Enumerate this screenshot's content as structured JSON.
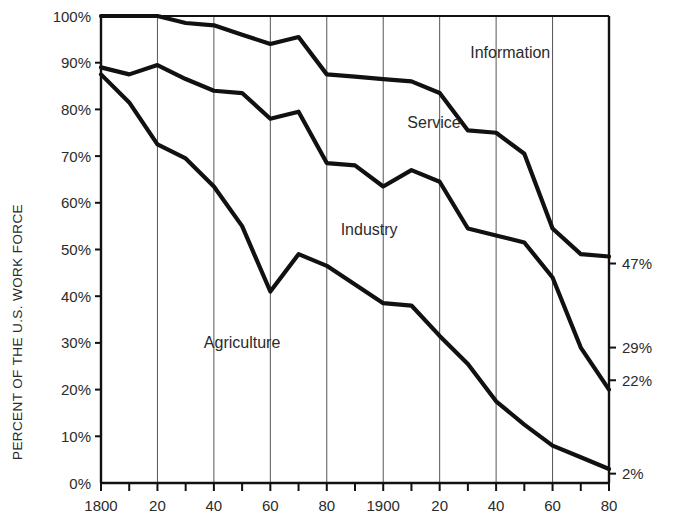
{
  "chart_data": {
    "type": "area",
    "title": "",
    "subtitle": "",
    "xlabel": "",
    "ylabel": "PERCENT OF THE U.S. WORK FORCE",
    "xlim": [
      1800,
      1980
    ],
    "ylim": [
      0,
      100
    ],
    "grid": "vertical gridlines every 20 years",
    "legend_position": "inline labels inside bands",
    "x_tick_interval": 10,
    "x_label_interval": 20,
    "y_tick_interval": 10,
    "x_tick_labels": [
      "1800",
      "20",
      "40",
      "60",
      "80",
      "1900",
      "20",
      "40",
      "60",
      "80"
    ],
    "x_tick_values": [
      1800,
      1820,
      1840,
      1860,
      1880,
      1900,
      1920,
      1940,
      1960,
      1980
    ],
    "y_tick_labels": [
      "0%",
      "10%",
      "20%",
      "30%",
      "40%",
      "50%",
      "60%",
      "70%",
      "80%",
      "90%",
      "100%"
    ],
    "y_tick_values": [
      0,
      10,
      20,
      30,
      40,
      50,
      60,
      70,
      80,
      90,
      100
    ],
    "right_axis_labels": [
      {
        "text": "47%",
        "value": 47
      },
      {
        "text": "29%",
        "value": 29
      },
      {
        "text": "22%",
        "value": 22
      },
      {
        "text": "2%",
        "value": 2
      }
    ],
    "x": [
      1800,
      1810,
      1820,
      1830,
      1840,
      1850,
      1860,
      1870,
      1880,
      1890,
      1900,
      1910,
      1920,
      1930,
      1940,
      1950,
      1960,
      1970,
      1980
    ],
    "boundaries": [
      {
        "name": "agriculture-top",
        "description": "top of Agriculture band (cumulative Agriculture)",
        "values": [
          87.5,
          81.5,
          72.5,
          69.5,
          63.5,
          55.0,
          41.0,
          49.0,
          46.5,
          42.5,
          38.5,
          38.0,
          31.5,
          25.5,
          17.5,
          12.5,
          8.0,
          5.5,
          3.0
        ]
      },
      {
        "name": "industry-top",
        "description": "top of Industry band (Agriculture + Industry)",
        "values": [
          89.0,
          87.5,
          89.5,
          86.5,
          84.0,
          83.5,
          78.0,
          79.5,
          68.5,
          68.0,
          63.5,
          67.0,
          64.5,
          54.5,
          53.0,
          51.5,
          44.0,
          29.0,
          20.0
        ]
      },
      {
        "name": "service-top",
        "description": "top of Service band (Agriculture + Industry + Service)",
        "values": [
          100.0,
          100.0,
          100.0,
          98.5,
          98.0,
          96.0,
          94.0,
          95.5,
          87.5,
          87.0,
          86.5,
          86.0,
          83.5,
          75.5,
          75.0,
          70.5,
          54.5,
          49.0,
          48.5
        ]
      }
    ],
    "series": [
      {
        "name": "Agriculture",
        "label_x": 1850,
        "label_y": 29,
        "values": [
          87.5,
          81.5,
          72.5,
          69.5,
          63.5,
          55.0,
          41.0,
          49.0,
          46.5,
          42.5,
          38.5,
          38.0,
          31.5,
          25.5,
          17.5,
          12.5,
          8.0,
          5.5,
          3.0
        ]
      },
      {
        "name": "Industry",
        "label_x": 1895,
        "label_y": 53,
        "values": [
          1.5,
          6.0,
          17.0,
          17.0,
          20.5,
          28.5,
          37.0,
          30.5,
          22.0,
          25.5,
          25.0,
          29.0,
          33.0,
          29.0,
          35.5,
          39.0,
          36.0,
          23.5,
          17.0
        ]
      },
      {
        "name": "Service",
        "label_x": 1918,
        "label_y": 76,
        "values": [
          11.0,
          12.5,
          10.5,
          12.0,
          14.0,
          12.5,
          16.0,
          16.0,
          19.0,
          19.0,
          23.0,
          19.0,
          19.0,
          21.0,
          22.0,
          19.0,
          10.5,
          20.0,
          28.5
        ]
      },
      {
        "name": "Information",
        "label_x": 1945,
        "label_y": 91,
        "values": [
          0.0,
          0.0,
          0.0,
          1.5,
          2.0,
          4.0,
          6.0,
          4.5,
          12.5,
          13.0,
          13.5,
          14.0,
          16.5,
          24.5,
          25.0,
          29.5,
          45.5,
          51.0,
          51.5
        ]
      }
    ]
  },
  "axis": {
    "y_title": "PERCENT OF THE U.S. WORK FORCE"
  },
  "labels": {
    "agriculture": "Agriculture",
    "industry": "Industry",
    "service": "Service",
    "information": "Information"
  },
  "colors": {
    "line": "#111111",
    "gridline": "#555555",
    "axis": "#111111",
    "text": "#2b2b2b",
    "background": "#ffffff"
  }
}
